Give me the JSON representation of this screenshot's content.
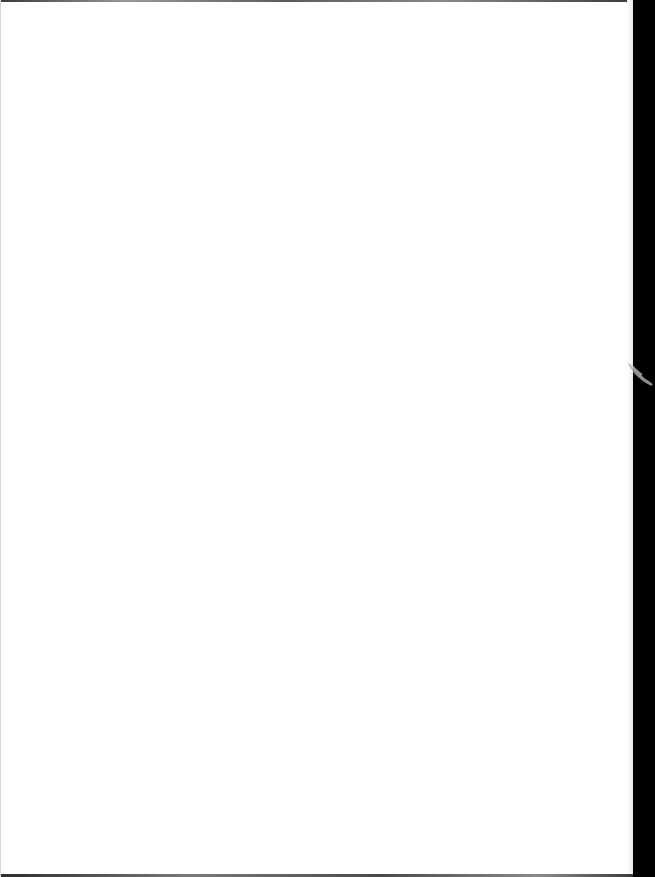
{
  "document": {
    "type": "scanned-page",
    "content_text": "",
    "page_color": "#ffffff",
    "background_color": "#000000",
    "artifacts": {
      "right_edge_strip": true,
      "right_edge_smudge": true,
      "top_edge_line": true,
      "bottom_edge_line": true
    }
  }
}
